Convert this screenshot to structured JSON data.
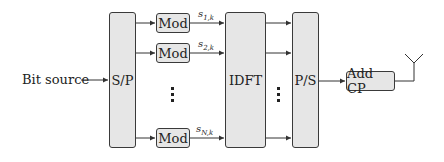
{
  "diagram": {
    "input": {
      "label": "Bit source"
    },
    "blocks": {
      "sp": {
        "label": "S/P"
      },
      "mod": [
        {
          "label": "Mod",
          "output": "s",
          "output_sub": "1,k"
        },
        {
          "label": "Mod",
          "output": "s",
          "output_sub": "2,k"
        },
        {
          "label": "Mod",
          "output": "s",
          "output_sub": "N,k"
        }
      ],
      "idft": {
        "label": "IDFT"
      },
      "ps": {
        "label": "P/S"
      },
      "add_cp": {
        "label": "Add CP"
      }
    },
    "ellipsis": "⋮",
    "output": {
      "icon": "antenna-icon"
    },
    "colors": {
      "block_fill": "#e6e6e6",
      "stroke": "#3a3a3a",
      "background": "#ffffff"
    }
  }
}
